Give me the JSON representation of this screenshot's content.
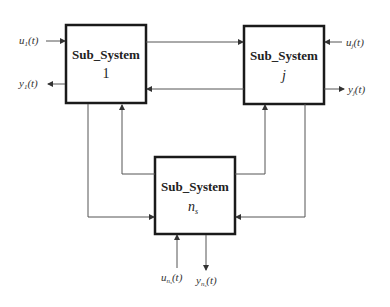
{
  "diagram": {
    "subsystems": [
      {
        "id": "sub1",
        "title": "Sub_System",
        "index": "1"
      },
      {
        "id": "subj",
        "title": "Sub_System",
        "index": "j"
      },
      {
        "id": "subns",
        "title": "Sub_System",
        "index": "n",
        "index_sub": "s"
      }
    ],
    "signals": {
      "u1": {
        "base": "u",
        "sub": "1",
        "arg": "(t)"
      },
      "y1": {
        "base": "y",
        "sub": "1",
        "arg": "(t)"
      },
      "uj": {
        "base": "u",
        "sub": "j",
        "arg": "(t)"
      },
      "yj": {
        "base": "y",
        "sub": "j",
        "arg": "(t)"
      },
      "uns": {
        "base": "u",
        "sub": "n",
        "subsub": "s",
        "arg": "(t)"
      },
      "yns": {
        "base": "y",
        "sub": "n",
        "subsub": "s",
        "arg": "(t)"
      }
    },
    "colors": {
      "box_border": "#1a1a1a",
      "line": "#555555",
      "text": "#333333"
    }
  }
}
